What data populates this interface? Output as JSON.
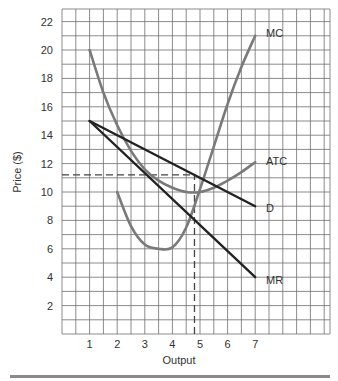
{
  "chart_data": {
    "type": "line",
    "title": "",
    "xlabel": "Output",
    "ylabel": "Price ($)",
    "xlim": [
      0,
      9.7
    ],
    "ylim": [
      0,
      22.8
    ],
    "x_ticks": [
      "1",
      "2",
      "3",
      "4",
      "5",
      "6",
      "7"
    ],
    "y_ticks": [
      "2",
      "4",
      "6",
      "8",
      "10",
      "12",
      "14",
      "16",
      "18",
      "20",
      "22"
    ],
    "grid": true,
    "series": [
      {
        "name": "MC",
        "color": "#7a7a7a",
        "points": [
          [
            2,
            10
          ],
          [
            2.5,
            7.6
          ],
          [
            3,
            6.3
          ],
          [
            3.5,
            6.0
          ],
          [
            4,
            6.1
          ],
          [
            4.5,
            7.5
          ],
          [
            5,
            10.2
          ],
          [
            5.5,
            13.2
          ],
          [
            6,
            16.2
          ],
          [
            6.5,
            18.8
          ],
          [
            7,
            21
          ]
        ]
      },
      {
        "name": "ATC",
        "color": "#7a7a7a",
        "points": [
          [
            1,
            20
          ],
          [
            1.5,
            17
          ],
          [
            2,
            14.7
          ],
          [
            2.5,
            12.9
          ],
          [
            3,
            11.6
          ],
          [
            3.5,
            10.8
          ],
          [
            4,
            10.3
          ],
          [
            4.5,
            10.0
          ],
          [
            5,
            10.0
          ],
          [
            5.5,
            10.3
          ],
          [
            6,
            10.8
          ],
          [
            6.5,
            11.4
          ],
          [
            7,
            12.1
          ]
        ]
      },
      {
        "name": "D",
        "color": "#222222",
        "points": [
          [
            1,
            15
          ],
          [
            7,
            9
          ]
        ]
      },
      {
        "name": "MR",
        "color": "#222222",
        "points": [
          [
            1,
            15
          ],
          [
            7,
            4
          ]
        ]
      }
    ],
    "annotations": [
      {
        "type": "hline-dashed",
        "y": 11.2,
        "x_from": 0,
        "x_to": 4.8
      },
      {
        "type": "vline-dashed",
        "x": 4.8,
        "y_from": 0,
        "y_to": 11.2
      }
    ],
    "labels": {
      "mc": "MC",
      "atc": "ATC",
      "d": "D",
      "mr": "MR"
    }
  }
}
